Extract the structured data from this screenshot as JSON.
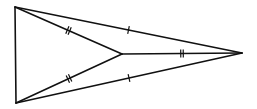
{
  "diagram": {
    "type": "geometry",
    "stroke_color": "#111111",
    "background": "#ffffff",
    "points": {
      "A": {
        "x": 15,
        "y": 7
      },
      "B": {
        "x": 16,
        "y": 103
      },
      "C": {
        "x": 242,
        "y": 53
      },
      "D": {
        "x": 122,
        "y": 54
      }
    },
    "segments": [
      {
        "from": "A",
        "to": "B",
        "ticks": 0
      },
      {
        "from": "A",
        "to": "C",
        "ticks": 1
      },
      {
        "from": "B",
        "to": "C",
        "ticks": 1
      },
      {
        "from": "A",
        "to": "D",
        "ticks": 2
      },
      {
        "from": "B",
        "to": "D",
        "ticks": 2
      },
      {
        "from": "D",
        "to": "C",
        "ticks": 2
      }
    ],
    "congruence_groups": [
      {
        "ticks": 1,
        "segments": [
          "AC",
          "BC"
        ]
      },
      {
        "ticks": 2,
        "segments": [
          "AD",
          "BD",
          "DC"
        ]
      }
    ]
  }
}
